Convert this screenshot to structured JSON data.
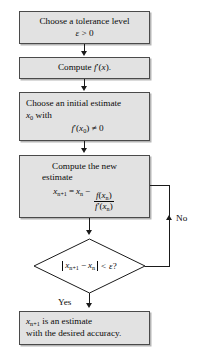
{
  "diagram": {
    "type": "flowchart",
    "colors": {
      "node_fill": "#e2e2e2",
      "node_border": "#4a4a4a",
      "connector": "#1a1a1a",
      "text": "#0a0a0a",
      "background": "#ffffff"
    }
  },
  "nodes": {
    "tolerance": {
      "shape": "process",
      "line1": "Choose a tolerance level",
      "line2_epsilon": "ε",
      "line2_rest": "> 0"
    },
    "derivative": {
      "shape": "process",
      "text_prefix": "Compute",
      "text_fn": "f",
      "text_prime": "′(",
      "text_var": "x",
      "text_suffix": ")."
    },
    "initial": {
      "shape": "process",
      "line1": "Choose an initial estimate",
      "line2_var": "x",
      "line2_sub": "0",
      "line2_rest": "with",
      "line3_fn": "f",
      "line3_prime": "′(",
      "line3_var": "x",
      "line3_sub": "0",
      "line3_rest": ") ≠ 0"
    },
    "newton": {
      "shape": "process",
      "line1": "Compute the new",
      "line2": "estimate",
      "formula_lhs_var": "x",
      "formula_lhs_sub": "n+1",
      "formula_eq": "=",
      "formula_rhs_var": "x",
      "formula_rhs_sub": "n",
      "formula_minus": "−",
      "formula_num_fn": "f",
      "formula_num_arg_var": "x",
      "formula_num_arg_sub": "n",
      "formula_den_fn": "f",
      "formula_den_prime": "′",
      "formula_den_arg_var": "x",
      "formula_den_arg_sub": "n"
    },
    "decision": {
      "shape": "diamond",
      "var1": "x",
      "sub1": "n+1",
      "minus": "−",
      "var2": "x",
      "sub2": "n",
      "compare": "<",
      "epsilon": "ε",
      "question": "?"
    },
    "result": {
      "shape": "process",
      "line1_var": "x",
      "line1_sub": "n+1",
      "line1_rest": "is an estimate",
      "line2": "with the desired accuracy."
    }
  },
  "edges": {
    "no_label": "No",
    "yes_label": "Yes"
  }
}
